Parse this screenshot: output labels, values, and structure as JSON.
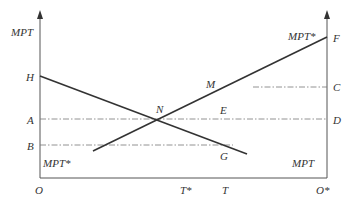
{
  "diagram": {
    "type": "box-diagram (two-origin marginal product of labor)",
    "left_axis": {
      "label": "MPT",
      "origin": "O"
    },
    "right_axis": {
      "label": "MPT*",
      "origin": "O*"
    },
    "curves": [
      {
        "name": "MPT",
        "from_point": "H",
        "to_point": "G",
        "label": "MPT"
      },
      {
        "name": "MPT*",
        "from_point": "B-level",
        "to_point": "F",
        "label": "MPT*"
      }
    ],
    "points": {
      "H": "H",
      "A": "A",
      "B": "B",
      "N": "N",
      "M": "M",
      "E": "E",
      "G": "G",
      "F": "F",
      "C": "C",
      "D": "D"
    },
    "x_labels": {
      "O": "O",
      "T_star": "T*",
      "T": "T",
      "O_star": "O*"
    },
    "curve_labels": {
      "mpt_left_top": "MPT",
      "mpt_star_bottom_left": "MPT*",
      "mpt_star_top_right": "MPT*",
      "mpt_bottom_right": "MPT"
    },
    "dashed_lines": [
      {
        "from": "A",
        "to": "D",
        "through": [
          "N",
          "E"
        ]
      },
      {
        "from": "B",
        "to": "G"
      },
      {
        "from": "M",
        "to": "C"
      }
    ]
  }
}
